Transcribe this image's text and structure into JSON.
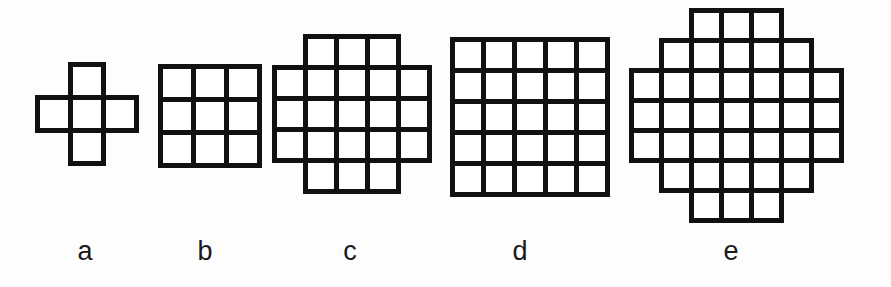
{
  "figure": {
    "background_color": "#fdfdfd",
    "stroke_color": "#111111",
    "cell_fill_color": "#ffffff",
    "label_color": "#1a1a1a",
    "shapes": [
      {
        "label": "a",
        "name": "shape-a-plus-pentomino",
        "cell_count": 5,
        "grid_cols": 3,
        "grid_rows": 3,
        "cell_size": 33,
        "stroke_width": 5,
        "origin_x": 37,
        "origin_y": 64,
        "label_x": 85,
        "label_y": 238,
        "rows_filled": [
          1,
          3,
          1
        ],
        "cells": [
          [
            0,
            1
          ],
          [
            1,
            0
          ],
          [
            1,
            1
          ],
          [
            1,
            2
          ],
          [
            2,
            1
          ]
        ]
      },
      {
        "label": "b",
        "name": "shape-b-3x3-square",
        "cell_count": 9,
        "grid_cols": 3,
        "grid_rows": 3,
        "cell_size": 33,
        "stroke_width": 5,
        "origin_x": 160,
        "origin_y": 66,
        "label_x": 205,
        "label_y": 238,
        "rows_filled": [
          3,
          3,
          3
        ],
        "cells": [
          [
            0,
            0
          ],
          [
            0,
            1
          ],
          [
            0,
            2
          ],
          [
            1,
            0
          ],
          [
            1,
            1
          ],
          [
            1,
            2
          ],
          [
            2,
            0
          ],
          [
            2,
            1
          ],
          [
            2,
            2
          ]
        ]
      },
      {
        "label": "c",
        "name": "shape-c-5x5-corners-removed",
        "cell_count": 21,
        "grid_cols": 5,
        "grid_rows": 5,
        "cell_size": 31,
        "stroke_width": 5,
        "origin_x": 274,
        "origin_y": 36,
        "label_x": 350,
        "label_y": 238,
        "rows_filled": [
          3,
          5,
          5,
          5,
          3
        ],
        "cells": [
          [
            0,
            1
          ],
          [
            0,
            2
          ],
          [
            0,
            3
          ],
          [
            1,
            0
          ],
          [
            1,
            1
          ],
          [
            1,
            2
          ],
          [
            1,
            3
          ],
          [
            1,
            4
          ],
          [
            2,
            0
          ],
          [
            2,
            1
          ],
          [
            2,
            2
          ],
          [
            2,
            3
          ],
          [
            2,
            4
          ],
          [
            3,
            0
          ],
          [
            3,
            1
          ],
          [
            3,
            2
          ],
          [
            3,
            3
          ],
          [
            3,
            4
          ],
          [
            4,
            1
          ],
          [
            4,
            2
          ],
          [
            4,
            3
          ]
        ]
      },
      {
        "label": "d",
        "name": "shape-d-5x5-square",
        "cell_count": 25,
        "grid_cols": 5,
        "grid_rows": 5,
        "cell_size": 31,
        "stroke_width": 5,
        "origin_x": 452,
        "origin_y": 39,
        "label_x": 520,
        "label_y": 238,
        "rows_filled": [
          5,
          5,
          5,
          5,
          5
        ],
        "cells": [
          [
            0,
            0
          ],
          [
            0,
            1
          ],
          [
            0,
            2
          ],
          [
            0,
            3
          ],
          [
            0,
            4
          ],
          [
            1,
            0
          ],
          [
            1,
            1
          ],
          [
            1,
            2
          ],
          [
            1,
            3
          ],
          [
            1,
            4
          ],
          [
            2,
            0
          ],
          [
            2,
            1
          ],
          [
            2,
            2
          ],
          [
            2,
            3
          ],
          [
            2,
            4
          ],
          [
            3,
            0
          ],
          [
            3,
            1
          ],
          [
            3,
            2
          ],
          [
            3,
            3
          ],
          [
            3,
            4
          ],
          [
            4,
            0
          ],
          [
            4,
            1
          ],
          [
            4,
            2
          ],
          [
            4,
            3
          ],
          [
            4,
            4
          ]
        ]
      },
      {
        "label": "e",
        "name": "shape-e-7x7-octagon",
        "cell_count": 37,
        "grid_cols": 7,
        "grid_rows": 7,
        "cell_size": 30,
        "stroke_width": 5,
        "origin_x": 631,
        "origin_y": 10,
        "label_x": 731,
        "label_y": 238,
        "rows_filled": [
          3,
          5,
          7,
          7,
          7,
          5,
          3
        ],
        "cells": [
          [
            0,
            2
          ],
          [
            0,
            3
          ],
          [
            0,
            4
          ],
          [
            1,
            1
          ],
          [
            1,
            2
          ],
          [
            1,
            3
          ],
          [
            1,
            4
          ],
          [
            1,
            5
          ],
          [
            2,
            0
          ],
          [
            2,
            1
          ],
          [
            2,
            2
          ],
          [
            2,
            3
          ],
          [
            2,
            4
          ],
          [
            2,
            5
          ],
          [
            2,
            6
          ],
          [
            3,
            0
          ],
          [
            3,
            1
          ],
          [
            3,
            2
          ],
          [
            3,
            3
          ],
          [
            3,
            4
          ],
          [
            3,
            5
          ],
          [
            3,
            6
          ],
          [
            4,
            0
          ],
          [
            4,
            1
          ],
          [
            4,
            2
          ],
          [
            4,
            3
          ],
          [
            4,
            4
          ],
          [
            4,
            5
          ],
          [
            4,
            6
          ],
          [
            5,
            1
          ],
          [
            5,
            2
          ],
          [
            5,
            3
          ],
          [
            5,
            4
          ],
          [
            5,
            5
          ],
          [
            6,
            2
          ],
          [
            6,
            3
          ],
          [
            6,
            4
          ]
        ]
      }
    ]
  }
}
